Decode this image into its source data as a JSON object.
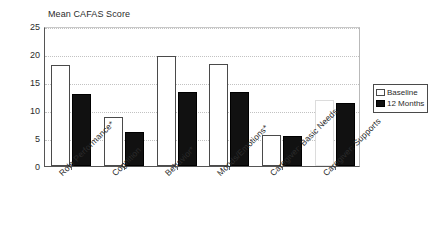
{
  "chart_data": {
    "type": "bar",
    "title": "Mean CAFAS Score",
    "xlabel": "",
    "ylabel": "",
    "ylim": [
      0,
      25
    ],
    "yticks": [
      0,
      5,
      10,
      15,
      20,
      25
    ],
    "grid": true,
    "legend_position": "right",
    "categories": [
      "Role Performance*",
      "Cognition",
      "Behavior*",
      "Moods/Emotions*",
      "Caregiver: Basic Needs",
      "Caregiver: Supports"
    ],
    "series": [
      {
        "name": "Baseline",
        "color": "#ffffff",
        "values": [
          18.0,
          8.7,
          19.6,
          18.3,
          5.6,
          11.7
        ]
      },
      {
        "name": "12 Months",
        "color": "#111111",
        "values": [
          12.9,
          6.0,
          13.2,
          13.2,
          5.4,
          11.2
        ]
      }
    ]
  },
  "legend": {
    "items": [
      {
        "label": "Baseline"
      },
      {
        "label": "12 Months"
      }
    ]
  }
}
